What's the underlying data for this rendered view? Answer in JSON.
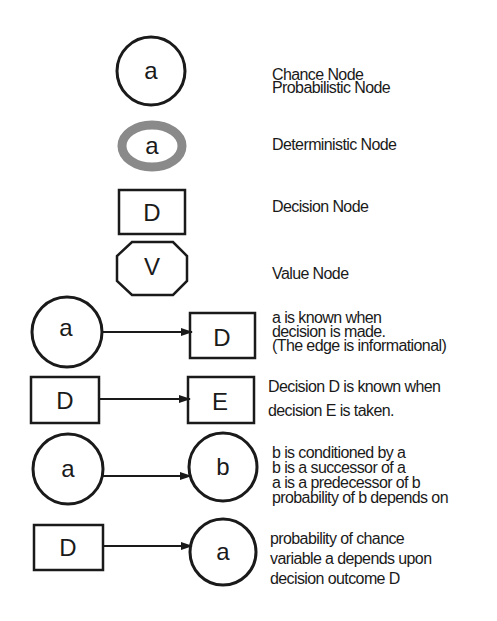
{
  "legend": [
    {
      "shape": "circle",
      "symbol": "a",
      "lines": [
        "Chance Node",
        "Probabilistic Node"
      ]
    },
    {
      "shape": "gray-ring-circle",
      "symbol": "a",
      "lines": [
        "Deterministic Node"
      ]
    },
    {
      "shape": "rectangle",
      "symbol": "D",
      "lines": [
        "Decision Node"
      ]
    },
    {
      "shape": "octagon",
      "symbol": "V",
      "lines": [
        "Value Node"
      ]
    }
  ],
  "relations": [
    {
      "from": {
        "shape": "circle",
        "symbol": "a"
      },
      "to": {
        "shape": "rectangle",
        "symbol": "D"
      },
      "lines": [
        "a is known when",
        "decision is made.",
        "(The edge is informational)"
      ]
    },
    {
      "from": {
        "shape": "rectangle",
        "symbol": "D"
      },
      "to": {
        "shape": "rectangle",
        "symbol": "E"
      },
      "lines": [
        "Decision D is known when",
        "decision E is taken."
      ]
    },
    {
      "from": {
        "shape": "circle",
        "symbol": "a"
      },
      "to": {
        "shape": "circle",
        "symbol": "b"
      },
      "lines": [
        "b is conditioned by a",
        "b is a successor of a",
        "a is a predecessor of b",
        "probability of b depends on"
      ]
    },
    {
      "from": {
        "shape": "rectangle",
        "symbol": "D"
      },
      "to": {
        "shape": "circle",
        "symbol": "a"
      },
      "lines": [
        "probability of chance",
        "variable a depends upon",
        "decision outcome D"
      ]
    }
  ],
  "colors": {
    "stroke": "#1a1a1a",
    "deterministic_ring": "#8a8a8a",
    "background": "#ffffff"
  }
}
